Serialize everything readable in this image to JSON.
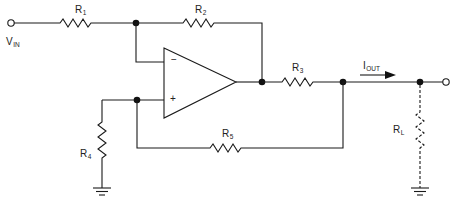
{
  "diagram": {
    "type": "op-amp circuit schematic (Howland current pump)",
    "labels": {
      "vin": {
        "main": "V",
        "sub": "IN"
      },
      "r1": {
        "main": "R",
        "sub": "1"
      },
      "r2": {
        "main": "R",
        "sub": "2"
      },
      "r3": {
        "main": "R",
        "sub": "3"
      },
      "r4": {
        "main": "R",
        "sub": "4"
      },
      "r5": {
        "main": "R",
        "sub": "5"
      },
      "rl": {
        "main": "R",
        "sub": "L"
      },
      "iout": {
        "main": "I",
        "sub": "OUT"
      }
    },
    "opamp": {
      "inverting_sign": "−",
      "noninverting_sign": "+"
    },
    "colors": {
      "line": "#1a1a1a",
      "background": "#ffffff"
    }
  }
}
